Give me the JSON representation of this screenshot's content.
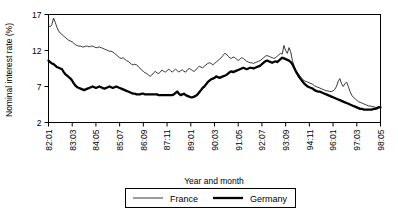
{
  "chart_data": {
    "type": "line",
    "title": "",
    "xlabel": "Year and month",
    "ylabel": "Nominal interest rate (%)",
    "ylim": [
      2,
      17
    ],
    "yticks": [
      2,
      7,
      12,
      17
    ],
    "grid": false,
    "legend_position": "bottom",
    "xtick_labels": [
      "82:01",
      "83:03",
      "84:05",
      "85:07",
      "86:09",
      "87:11",
      "89:01",
      "90:03",
      "91:05",
      "92:07",
      "93:09",
      "94:11",
      "96:01",
      "97:03",
      "98:05"
    ],
    "x_start": "82:01",
    "x_end": "98:05",
    "x_step_months": 1,
    "xtick_step_months": 14,
    "series": [
      {
        "name": "France",
        "style": "thin",
        "color": "#222222",
        "values": [
          15.5,
          15.3,
          15.6,
          16.5,
          15.9,
          15.2,
          14.7,
          14.4,
          14.2,
          14.0,
          13.8,
          13.6,
          13.4,
          13.3,
          13.2,
          13.0,
          12.8,
          12.7,
          12.6,
          12.6,
          12.5,
          12.5,
          12.6,
          12.6,
          12.5,
          12.6,
          12.6,
          12.5,
          12.4,
          12.4,
          12.5,
          12.4,
          12.3,
          12.2,
          12.1,
          12.0,
          11.9,
          11.9,
          11.8,
          11.6,
          11.4,
          11.2,
          11.0,
          10.9,
          11.0,
          10.8,
          10.6,
          10.5,
          10.3,
          10.1,
          10.0,
          10.1,
          10.0,
          9.8,
          9.5,
          9.3,
          9.1,
          8.9,
          8.8,
          8.6,
          8.4,
          8.6,
          8.9,
          9.1,
          8.9,
          8.8,
          9.0,
          9.3,
          9.1,
          9.0,
          9.2,
          9.4,
          9.2,
          9.0,
          9.2,
          9.4,
          9.2,
          9.0,
          9.2,
          9.3,
          9.1,
          9.0,
          9.3,
          9.5,
          9.4,
          9.2,
          9.1,
          9.3,
          9.6,
          9.8,
          9.7,
          9.6,
          9.8,
          10.0,
          10.2,
          10.3,
          10.2,
          10.0,
          10.2,
          10.4,
          10.6,
          10.8,
          11.0,
          11.3,
          11.6,
          11.5,
          11.2,
          11.0,
          10.9,
          11.1,
          11.0,
          10.8,
          10.6,
          10.8,
          11.0,
          10.9,
          10.7,
          10.5,
          10.4,
          10.3,
          10.3,
          10.2,
          10.3,
          10.4,
          10.5,
          10.6,
          10.8,
          11.0,
          11.2,
          11.3,
          11.2,
          11.1,
          11.0,
          10.9,
          11.0,
          11.2,
          11.4,
          11.6,
          11.5,
          12.7,
          12.0,
          11.6,
          12.4,
          11.8,
          10.6,
          9.8,
          9.3,
          8.9,
          8.6,
          8.3,
          8.0,
          7.8,
          7.7,
          7.6,
          7.5,
          7.4,
          7.3,
          7.1,
          7.0,
          6.9,
          6.8,
          6.7,
          6.6,
          6.5,
          6.4,
          6.4,
          6.3,
          6.3,
          6.4,
          6.6,
          7.0,
          7.7,
          8.1,
          7.4,
          7.0,
          7.4,
          7.6,
          7.0,
          6.3,
          5.8,
          5.5,
          5.3,
          5.1,
          4.9,
          4.8,
          4.7,
          4.6,
          4.5,
          4.4,
          4.3,
          4.3,
          4.2,
          4.2,
          4.1,
          4.1,
          4.2,
          4.2
        ]
      },
      {
        "name": "Germany",
        "style": "thick",
        "color": "#000000",
        "values": [
          10.6,
          10.4,
          10.2,
          10.1,
          9.9,
          9.7,
          9.6,
          9.5,
          9.4,
          9.0,
          8.7,
          8.5,
          8.3,
          8.1,
          7.8,
          7.4,
          7.1,
          6.9,
          6.8,
          6.7,
          6.6,
          6.5,
          6.6,
          6.7,
          6.8,
          6.9,
          7.0,
          6.9,
          6.8,
          6.9,
          7.0,
          6.9,
          6.8,
          6.7,
          6.8,
          6.9,
          7.0,
          6.9,
          6.8,
          6.9,
          7.0,
          6.9,
          6.8,
          6.7,
          6.6,
          6.5,
          6.4,
          6.3,
          6.2,
          6.1,
          6.0,
          6.0,
          5.9,
          5.9,
          5.9,
          6.0,
          6.0,
          5.9,
          5.9,
          5.9,
          5.9,
          5.9,
          5.9,
          5.9,
          5.9,
          5.8,
          5.8,
          5.8,
          5.8,
          5.8,
          5.8,
          5.8,
          5.8,
          5.8,
          5.9,
          6.1,
          6.3,
          6.0,
          5.8,
          5.9,
          6.0,
          5.8,
          5.7,
          5.6,
          5.5,
          5.5,
          5.6,
          5.7,
          5.9,
          6.2,
          6.5,
          6.8,
          7.0,
          7.3,
          7.6,
          7.8,
          8.0,
          8.1,
          8.2,
          8.4,
          8.3,
          8.2,
          8.3,
          8.4,
          8.5,
          8.6,
          8.8,
          9.0,
          9.1,
          9.0,
          9.1,
          9.2,
          9.3,
          9.4,
          9.5,
          9.6,
          9.5,
          9.4,
          9.5,
          9.6,
          9.6,
          9.5,
          9.6,
          9.7,
          9.8,
          9.9,
          10.1,
          10.3,
          10.5,
          10.6,
          10.5,
          10.4,
          10.3,
          10.4,
          10.5,
          10.4,
          10.6,
          10.8,
          11.0,
          10.9,
          10.8,
          10.7,
          10.6,
          10.4,
          10.1,
          9.6,
          9.1,
          8.7,
          8.3,
          8.0,
          7.7,
          7.4,
          7.2,
          7.0,
          6.9,
          6.8,
          6.7,
          6.5,
          6.4,
          6.3,
          6.3,
          6.2,
          6.1,
          6.0,
          5.9,
          5.8,
          5.7,
          5.6,
          5.5,
          5.4,
          5.3,
          5.2,
          5.1,
          5.0,
          4.9,
          4.8,
          4.7,
          4.6,
          4.5,
          4.4,
          4.3,
          4.2,
          4.1,
          4.0,
          3.9,
          3.9,
          3.8,
          3.8,
          3.8,
          3.8,
          3.8,
          3.8,
          3.9,
          3.9,
          4.0,
          4.1,
          4.1
        ]
      }
    ]
  },
  "legend": {
    "france_label": "France",
    "germany_label": "Germany"
  },
  "axes": {
    "ylabel": "Nominal interest rate (%)",
    "xlabel": "Year and month"
  }
}
